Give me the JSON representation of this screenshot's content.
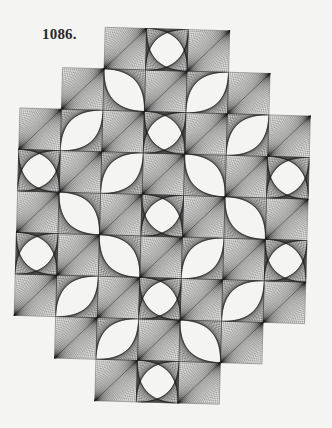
{
  "plate": {
    "label": "1086."
  },
  "figure": {
    "grid": {
      "origin_x": 17,
      "origin_y": 29,
      "cell_size": 41.5,
      "rotation_deg": 1.6,
      "lines_per_cell": 22
    },
    "colors": {
      "background": "#f4f4f2",
      "ink": "#1e1e1e"
    },
    "rows": [
      {
        "row": 0,
        "cells": [
          {
            "col": 2,
            "type": "hatch"
          },
          {
            "col": 3,
            "type": "star"
          },
          {
            "col": 4,
            "type": "hatch"
          }
        ]
      },
      {
        "row": 1,
        "cells": [
          {
            "col": 1,
            "type": "hatch"
          },
          {
            "col": 2,
            "type": "lens-nwse"
          },
          {
            "col": 3,
            "type": "hatch"
          },
          {
            "col": 4,
            "type": "lens-nesw"
          },
          {
            "col": 5,
            "type": "hatch"
          }
        ]
      },
      {
        "row": 2,
        "cells": [
          {
            "col": 0,
            "type": "hatch"
          },
          {
            "col": 1,
            "type": "lens-nesw"
          },
          {
            "col": 2,
            "type": "hatch"
          },
          {
            "col": 3,
            "type": "star"
          },
          {
            "col": 4,
            "type": "hatch"
          },
          {
            "col": 5,
            "type": "lens-nesw"
          },
          {
            "col": 6,
            "type": "hatch"
          }
        ]
      },
      {
        "row": 3,
        "cells": [
          {
            "col": 0,
            "type": "star"
          },
          {
            "col": 1,
            "type": "hatch"
          },
          {
            "col": 2,
            "type": "lens-nesw"
          },
          {
            "col": 3,
            "type": "hatch"
          },
          {
            "col": 4,
            "type": "lens-nwse"
          },
          {
            "col": 5,
            "type": "hatch"
          },
          {
            "col": 6,
            "type": "star"
          }
        ]
      },
      {
        "row": 4,
        "cells": [
          {
            "col": 0,
            "type": "hatch"
          },
          {
            "col": 1,
            "type": "lens-nwse"
          },
          {
            "col": 2,
            "type": "hatch"
          },
          {
            "col": 3,
            "type": "star"
          },
          {
            "col": 4,
            "type": "hatch"
          },
          {
            "col": 5,
            "type": "lens-nwse"
          },
          {
            "col": 6,
            "type": "hatch"
          }
        ]
      },
      {
        "row": 5,
        "cells": [
          {
            "col": 0,
            "type": "star"
          },
          {
            "col": 1,
            "type": "hatch"
          },
          {
            "col": 2,
            "type": "lens-nwse"
          },
          {
            "col": 3,
            "type": "hatch"
          },
          {
            "col": 4,
            "type": "lens-nesw"
          },
          {
            "col": 5,
            "type": "hatch"
          },
          {
            "col": 6,
            "type": "star"
          }
        ]
      },
      {
        "row": 6,
        "cells": [
          {
            "col": 0,
            "type": "hatch"
          },
          {
            "col": 1,
            "type": "lens-nesw"
          },
          {
            "col": 2,
            "type": "hatch"
          },
          {
            "col": 3,
            "type": "star"
          },
          {
            "col": 4,
            "type": "hatch"
          },
          {
            "col": 5,
            "type": "lens-nesw"
          },
          {
            "col": 6,
            "type": "hatch"
          }
        ]
      },
      {
        "row": 7,
        "cells": [
          {
            "col": 1,
            "type": "hatch"
          },
          {
            "col": 2,
            "type": "lens-nesw"
          },
          {
            "col": 3,
            "type": "hatch"
          },
          {
            "col": 4,
            "type": "lens-nwse"
          },
          {
            "col": 5,
            "type": "hatch"
          }
        ]
      },
      {
        "row": 8,
        "cells": [
          {
            "col": 2,
            "type": "hatch"
          },
          {
            "col": 3,
            "type": "star"
          },
          {
            "col": 4,
            "type": "hatch"
          }
        ]
      }
    ]
  }
}
